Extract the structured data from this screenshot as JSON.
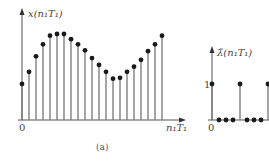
{
  "chart_data": [
    {
      "type": "stem",
      "panel": "left",
      "caption": "(a)",
      "ylabel": "x(n₁T₁)",
      "xlabel": "n₁T₁",
      "origin_label": "0",
      "x": [
        0,
        1,
        2,
        3,
        4,
        5,
        6,
        7,
        8,
        9,
        10,
        11,
        12,
        13,
        14,
        15,
        16,
        17,
        18,
        19,
        20
      ],
      "values": [
        0.42,
        0.56,
        0.74,
        0.88,
        0.98,
        1.0,
        1.0,
        0.94,
        0.88,
        0.81,
        0.72,
        0.64,
        0.56,
        0.48,
        0.49,
        0.56,
        0.62,
        0.7,
        0.8,
        0.88,
        0.98
      ],
      "grid": false
    },
    {
      "type": "stem",
      "panel": "right",
      "ylabel": "λ̃(n₁T₁)",
      "origin_label": "0",
      "ytick_label": "1",
      "x": [
        0,
        1,
        2,
        3,
        4,
        5,
        6,
        7,
        8
      ],
      "values": [
        1,
        0,
        0,
        0,
        1,
        0,
        0,
        0,
        1
      ],
      "grid": false
    }
  ],
  "layout": {
    "left": {
      "origin_x": 22,
      "baseline_y": 120,
      "spacing": 7,
      "scale_px": 86,
      "axis_top_y": 10,
      "axis_right_x": 184
    },
    "right": {
      "origin_x": 212,
      "baseline_y": 120,
      "spacing": 7,
      "scale_px": 36,
      "axis_top_y": 48
    }
  },
  "labels": {
    "left_ylabel": "x(n₁T₁)",
    "left_xlabel": "n₁T₁",
    "left_origin": "0",
    "caption": "(a)",
    "right_ylabel": "λ̃(n₁T₁)",
    "right_one": "1",
    "right_origin": "0"
  }
}
